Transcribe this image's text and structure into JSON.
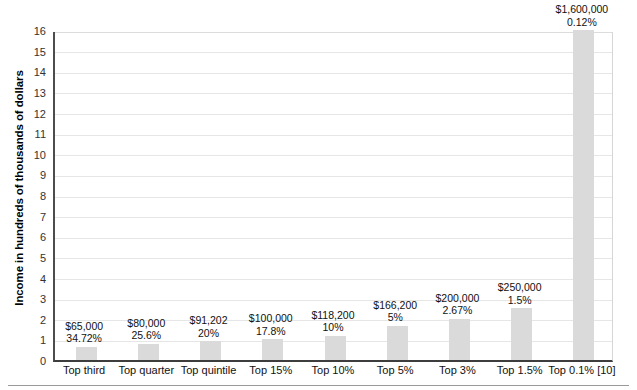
{
  "chart_data": {
    "type": "bar",
    "title": "",
    "xlabel": "",
    "ylabel": "Income in hundreds of thousands of dollars",
    "ylim": [
      0,
      16
    ],
    "ytick_step": 1,
    "yticks": [
      "0",
      "1",
      "2",
      "3",
      "4",
      "5",
      "6",
      "7",
      "8",
      "9",
      "10",
      "11",
      "12",
      "13",
      "14",
      "15",
      "16"
    ],
    "grid": true,
    "legend": "none",
    "bar_color": "#dadada",
    "axis_color": "#3d3d3d",
    "gridline_color": "#e6e6e6",
    "units_note": "values plotted in hundreds of thousands of dollars",
    "categories": [
      "Top third",
      "Top quarter",
      "Top quintile",
      "Top 15%",
      "Top 10%",
      "Top 5%",
      "Top 3%",
      "Top 1.5%",
      "Top 0.1% [10]"
    ],
    "values": [
      0.65,
      0.8,
      0.91202,
      1.0,
      1.182,
      1.662,
      2.0,
      2.5,
      16.0
    ],
    "point_labels": [
      {
        "amount": "$65,000",
        "percent": "34.72%"
      },
      {
        "amount": "$80,000",
        "percent": "25.6%"
      },
      {
        "amount": "$91,202",
        "percent": "20%"
      },
      {
        "amount": "$100,000",
        "percent": "17.8%"
      },
      {
        "amount": "$118,200",
        "percent": "10%"
      },
      {
        "amount": "$166,200",
        "percent": "5%"
      },
      {
        "amount": "$200,000",
        "percent": "2.67%"
      },
      {
        "amount": "$250,000",
        "percent": "1.5%"
      },
      {
        "amount": "$1,600,000",
        "percent": "0.12%"
      }
    ]
  }
}
